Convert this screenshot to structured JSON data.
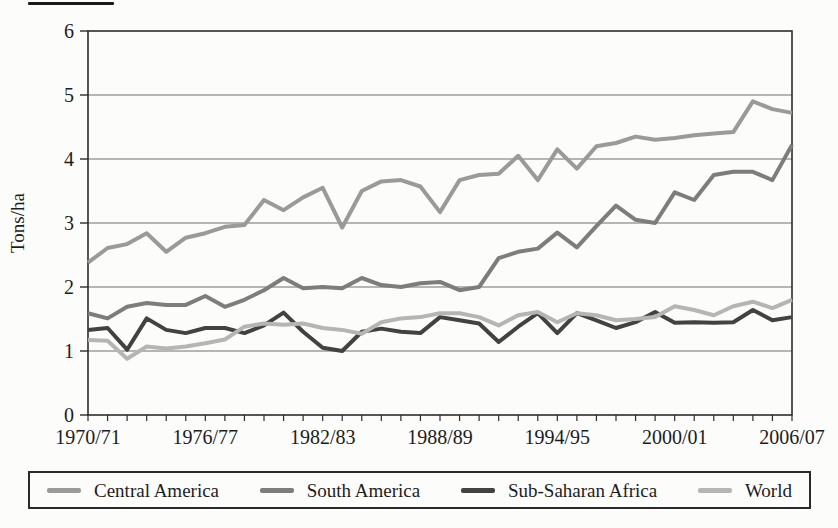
{
  "figure": {
    "ylabel": "Tons/ha"
  },
  "chart_data": {
    "type": "line",
    "title": "",
    "xlabel": "",
    "ylabel": "Tons/ha",
    "ylim": [
      0,
      6
    ],
    "y_ticks": [
      0,
      1,
      2,
      3,
      4,
      5,
      6
    ],
    "grid": "horizontal",
    "legend_position": "bottom",
    "x_unit": "crop year (1970/71 - 2006/07, one point per year)",
    "x_tick_labels": [
      "1970/71",
      "1976/77",
      "1982/83",
      "1988/89",
      "1994/95",
      "2000/01",
      "2006/07"
    ],
    "x_tick_positions": [
      0,
      6,
      12,
      18,
      24,
      30,
      36
    ],
    "series": [
      {
        "name": "Central America",
        "color": "#9a9a9a",
        "values": [
          2.38,
          2.61,
          2.67,
          2.84,
          2.55,
          2.77,
          2.84,
          2.94,
          2.97,
          3.36,
          3.2,
          3.4,
          3.55,
          2.93,
          3.5,
          3.65,
          3.67,
          3.57,
          3.17,
          3.67,
          3.75,
          3.77,
          4.05,
          3.67,
          4.15,
          3.85,
          4.2,
          4.25,
          4.35,
          4.3,
          4.33,
          4.37,
          4.4,
          4.42,
          4.9,
          4.78,
          4.72
        ]
      },
      {
        "name": "South America",
        "color": "#7d7d7d",
        "values": [
          1.59,
          1.51,
          1.69,
          1.75,
          1.72,
          1.72,
          1.86,
          1.69,
          1.8,
          1.95,
          2.14,
          1.98,
          2.0,
          1.98,
          2.14,
          2.03,
          2.0,
          2.06,
          2.08,
          1.95,
          2.0,
          2.45,
          2.55,
          2.6,
          2.85,
          2.62,
          2.95,
          3.27,
          3.05,
          3.0,
          3.48,
          3.36,
          3.75,
          3.8,
          3.8,
          3.67,
          4.22
        ]
      },
      {
        "name": "Sub-Saharan Africa",
        "color": "#424242",
        "values": [
          1.33,
          1.36,
          1.02,
          1.51,
          1.33,
          1.28,
          1.36,
          1.36,
          1.28,
          1.4,
          1.6,
          1.3,
          1.05,
          1.0,
          1.3,
          1.35,
          1.3,
          1.28,
          1.53,
          1.48,
          1.43,
          1.14,
          1.38,
          1.59,
          1.28,
          1.59,
          1.48,
          1.36,
          1.45,
          1.61,
          1.44,
          1.45,
          1.44,
          1.45,
          1.64,
          1.48,
          1.53
        ]
      },
      {
        "name": "World",
        "color": "#b5b5b5",
        "values": [
          1.17,
          1.16,
          0.88,
          1.07,
          1.04,
          1.07,
          1.12,
          1.18,
          1.38,
          1.43,
          1.41,
          1.43,
          1.36,
          1.33,
          1.27,
          1.45,
          1.51,
          1.53,
          1.59,
          1.59,
          1.53,
          1.4,
          1.56,
          1.61,
          1.45,
          1.59,
          1.56,
          1.48,
          1.5,
          1.53,
          1.7,
          1.64,
          1.56,
          1.7,
          1.77,
          1.67,
          1.8
        ]
      }
    ]
  },
  "style": {
    "axis_color": "#2c2c2c",
    "grid_color": "#6e6e6e",
    "line_width": 4
  }
}
